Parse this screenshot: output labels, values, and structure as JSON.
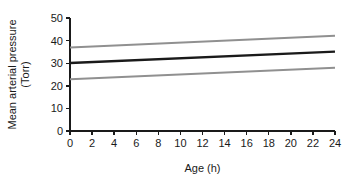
{
  "chart_data": {
    "type": "line",
    "title": "",
    "subtitle": "",
    "xlabel": "Age (h)",
    "ylabel": "Mean arterial pressure (Torr)",
    "ylabel_line1": "Mean arterial pressure",
    "ylabel_line2": "(Torr)",
    "xlim": [
      0,
      24
    ],
    "ylim": [
      0,
      50
    ],
    "xticks": [
      0,
      2,
      4,
      6,
      8,
      10,
      12,
      14,
      16,
      18,
      20,
      22,
      24
    ],
    "xticklabels": [
      "0",
      "2",
      "4",
      "6",
      "8",
      "10",
      "12",
      "14",
      "16",
      "18",
      "20",
      "22",
      "24"
    ],
    "yticks": [
      0,
      10,
      20,
      30,
      40,
      50
    ],
    "yticklabels": [
      "0",
      "10",
      "20",
      "30",
      "40",
      "50"
    ],
    "grid": false,
    "legend": false,
    "legend_position": "none",
    "x": [
      0,
      24
    ],
    "series": [
      {
        "name": "Upper limit",
        "values": [
          37,
          42.2
        ],
        "color": "#909090",
        "width": 2.0,
        "style": "solid"
      },
      {
        "name": "Mean",
        "values": [
          30.1,
          35.1
        ],
        "color": "#1a1a1a",
        "width": 2.4,
        "style": "solid"
      },
      {
        "name": "Lower limit",
        "values": [
          22.9,
          28.0
        ],
        "color": "#909090",
        "width": 2.0,
        "style": "solid"
      }
    ],
    "axis_color": "#1a1a1a",
    "background": "#ffffff"
  }
}
